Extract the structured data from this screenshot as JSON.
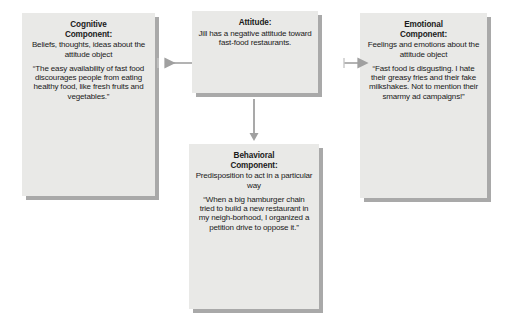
{
  "diagram": {
    "background_color": "#ffffff",
    "box_fill_color": "#e9e9e7",
    "box_shadow_color": "#a9a9a9",
    "arrow_color": "#a0a0a0",
    "text_color": "#1a1a1a"
  },
  "nodes": [
    {
      "id": "cognitive",
      "title": "Cognitive\nComponent:",
      "title_line1": "Cognitive",
      "title_line2": "Component:",
      "description": "Beliefs, thoughts, ideas about the attitude object",
      "quote": "“The easy availability of fast food discourages people from eating healthy food, like fresh fruits and vegetables.”"
    },
    {
      "id": "attitude",
      "title_line1": "Attitude:",
      "title_line2": "",
      "description": "Jill has a negative attitude toward fast-food restaurants.",
      "quote": ""
    },
    {
      "id": "emotional",
      "title_line1": "Emotional",
      "title_line2": "Component:",
      "description": "Feelings and emotions about the attitude object",
      "quote": "“Fast food is disgusting. I hate their greasy fries and their fake milkshakes. Not to mention their smarmy ad campaigns!”"
    },
    {
      "id": "behavioral",
      "title_line1": "Behavioral",
      "title_line2": "Component:",
      "description": "Predisposition to act in a particular way",
      "quote": "“When a big hamburger chain tried to build a new restaurant in my neigh-borhood, I organized a petition drive to oppose it.”"
    }
  ],
  "connectors": [
    {
      "id": "attitude-to-cognitive",
      "from": "attitude",
      "to": "cognitive",
      "direction": "left"
    },
    {
      "id": "attitude-to-emotional",
      "from": "attitude",
      "to": "emotional",
      "direction": "right"
    },
    {
      "id": "attitude-to-behavioral",
      "from": "attitude",
      "to": "behavioral",
      "direction": "down"
    }
  ]
}
